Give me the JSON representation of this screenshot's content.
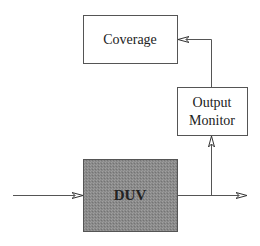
{
  "diagram": {
    "nodes": [
      {
        "id": "coverage",
        "label": "Coverage",
        "fill": "#ffffff"
      },
      {
        "id": "output_monitor",
        "label_lines": [
          "Output",
          "Monitor"
        ],
        "fill": "#ffffff"
      },
      {
        "id": "duv",
        "label": "DUV",
        "fill": "#8c8c8c"
      }
    ],
    "edges": [
      {
        "from": "input",
        "to": "duv"
      },
      {
        "from": "duv",
        "to": "output"
      },
      {
        "from": "duv",
        "to": "output_monitor"
      },
      {
        "from": "output_monitor",
        "to": "coverage"
      }
    ]
  }
}
